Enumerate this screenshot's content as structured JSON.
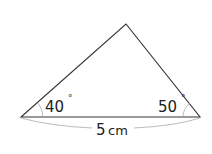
{
  "diagram": {
    "type": "triangle",
    "vertices": {
      "left": {
        "x": 21,
        "y": 117
      },
      "right": {
        "x": 200,
        "y": 117
      },
      "apex": {
        "x": 126,
        "y": 24
      }
    },
    "angles": {
      "left": {
        "value": "40",
        "unit": "°"
      },
      "right": {
        "value": "50",
        "unit": "°"
      }
    },
    "base": {
      "length_label": "5cm",
      "number": "5",
      "unit": "cm"
    },
    "colors": {
      "stroke": "#333333",
      "arc": "#aaaaaa",
      "text": "#222222"
    }
  }
}
